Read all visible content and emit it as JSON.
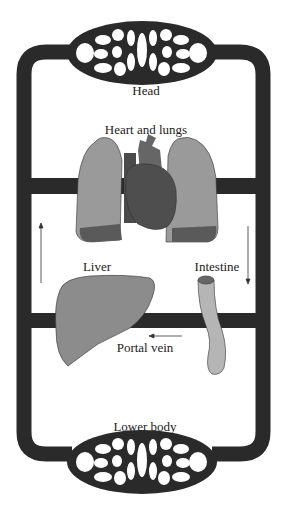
{
  "diagram": {
    "labels": {
      "head": "Head",
      "heart_lungs": "Heart and lungs",
      "liver": "Liver",
      "intestine": "Intestine",
      "portal_vein": "Portal vein",
      "lower_body": "Lower body"
    },
    "arrows": [
      {
        "id": "left-up",
        "direction": "up"
      },
      {
        "id": "right-down",
        "direction": "down"
      },
      {
        "id": "portal-left",
        "direction": "left"
      }
    ],
    "colors": {
      "vessel": "#2a2a2a",
      "lung": "#9a9a9a",
      "lung_shade": "#5a5a5a",
      "heart": "#555555",
      "liver": "#8c8c8c",
      "intestine": "#b5b5b5",
      "intestine_lumen": "#666666"
    }
  }
}
